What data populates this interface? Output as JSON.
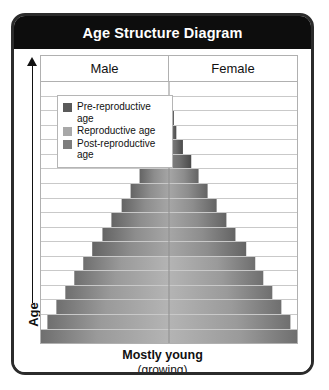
{
  "card": {
    "title": "Age Structure Diagram",
    "border_color": "#2b2b2b",
    "titlebar_color": "#0d0d0d"
  },
  "axis": {
    "y_label": "Age",
    "arrow_icon": "up-arrow-icon",
    "direction": "up"
  },
  "columns": {
    "left_label": "Male",
    "right_label": "Female"
  },
  "legend": {
    "items": [
      {
        "label": "Pre-reproductive age",
        "color": "#5a5a5a",
        "swatch_name": "pre-reproductive-swatch"
      },
      {
        "label": "Reproductive age",
        "color": "#a8a8a8",
        "swatch_name": "reproductive-swatch"
      },
      {
        "label": "Post-reproductive age",
        "color": "#7d7d7d",
        "swatch_name": "post-reproductive-swatch"
      }
    ]
  },
  "caption": {
    "main": "Mostly young",
    "sub": "(growing)"
  },
  "chart_data": {
    "type": "bar",
    "subtype": "population-pyramid",
    "title": "Age Structure Diagram",
    "xlabel": "",
    "ylabel": "Age",
    "grid": true,
    "legend_position": "top-left",
    "orientation": "horizontal-mirrored",
    "center_axis": "age-midline",
    "categories": [
      "row-1",
      "row-2",
      "row-3",
      "row-4",
      "row-5",
      "row-6",
      "row-7",
      "row-8",
      "row-9",
      "row-10",
      "row-11",
      "row-12",
      "row-13",
      "row-14",
      "row-15",
      "row-16",
      "row-17",
      "row-18"
    ],
    "series": [
      {
        "name": "Male",
        "values": [
          0,
          0,
          0,
          3,
          5,
          8,
          11,
          15,
          19,
          23,
          27,
          31,
          36,
          41,
          47,
          54,
          62,
          76
        ]
      },
      {
        "name": "Female",
        "values": [
          0,
          0,
          0,
          3,
          5,
          8,
          11,
          15,
          19,
          23,
          27,
          31,
          36,
          41,
          47,
          54,
          62,
          76
        ]
      }
    ],
    "total_width_pct": [
      0,
      0,
      0,
      6,
      10,
      16,
      22,
      30,
      38,
      46,
      54,
      62,
      72,
      82,
      94,
      100,
      100,
      100
    ],
    "bar_total_width_pct": [
      0,
      0,
      0,
      6,
      10,
      16,
      22,
      30,
      38,
      46,
      54,
      62,
      72,
      82,
      93,
      100,
      100,
      100
    ],
    "age_group_by_row": [
      "post-reproductive",
      "post-reproductive",
      "post-reproductive",
      "post-reproductive",
      "post-reproductive",
      "post-reproductive",
      "reproductive",
      "reproductive",
      "reproductive",
      "reproductive",
      "reproductive",
      "reproductive",
      "pre-reproductive",
      "pre-reproductive",
      "pre-reproductive",
      "pre-reproductive",
      "pre-reproductive",
      "pre-reproductive"
    ],
    "ylim": [
      0,
      18
    ],
    "annotations": [
      "Mostly young",
      "(growing)"
    ]
  },
  "rows": [
    {
      "width_pct": 0,
      "shade": "dark"
    },
    {
      "width_pct": 0,
      "shade": "dark"
    },
    {
      "width_pct": 4,
      "shade": "dark"
    },
    {
      "width_pct": 6,
      "shade": "dark"
    },
    {
      "width_pct": 11,
      "shade": "dark"
    },
    {
      "width_pct": 17,
      "shade": "dark"
    },
    {
      "width_pct": 23,
      "shade": "mid"
    },
    {
      "width_pct": 30,
      "shade": "mid"
    },
    {
      "width_pct": 37,
      "shade": "mid"
    },
    {
      "width_pct": 45,
      "shade": "mid"
    },
    {
      "width_pct": 52,
      "shade": "mid"
    },
    {
      "width_pct": 60,
      "shade": "mid"
    },
    {
      "width_pct": 67,
      "shade": "light"
    },
    {
      "width_pct": 74,
      "shade": "light"
    },
    {
      "width_pct": 81,
      "shade": "light"
    },
    {
      "width_pct": 88,
      "shade": "light"
    },
    {
      "width_pct": 95,
      "shade": "light"
    },
    {
      "width_pct": 100,
      "shade": "light"
    }
  ]
}
